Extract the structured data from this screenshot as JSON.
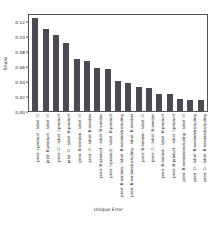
{
  "chart_data": {
    "type": "bar",
    "title": "",
    "xlabel": "Unique Error",
    "ylabel": "Share",
    "ylim": [
      0.0,
      0.13
    ],
    "ytick_labels": [
      "0.00",
      "0.02",
      "0.04",
      "0.06",
      "0.08",
      "0.10",
      "0.12"
    ],
    "ytick_values": [
      0.0,
      0.02,
      0.04,
      0.06,
      0.08,
      0.1,
      0.12
    ],
    "grid": false,
    "legend": null,
    "bar_color": "#4a4a52",
    "categories": [
      "pred: I-product - label: O",
      "pred: B-product - label: O",
      "pred: O - label: I-product",
      "pred: O - label: B-product",
      "pred: B-version - label: O",
      "pred: O - label: B-version",
      "pred: B-product - label: B-vendor",
      "pred: I-product - label: B-product",
      "pred: B-version - label: B-version/including",
      "pred: B-version/including - label: B-version",
      "pred: B-vendor - label: O",
      "pred: O - label: B-vendor",
      "pred: B-vendor - label: B-product",
      "pred: B-product - label: I-product",
      "pred: B-version/including - label: O",
      "pred: O - label: B-version/including",
      "pred: O - label: B-version/including"
    ],
    "values": [
      0.123,
      0.109,
      0.101,
      0.09,
      0.069,
      0.066,
      0.057,
      0.056,
      0.04,
      0.037,
      0.032,
      0.03,
      0.023,
      0.023,
      0.016,
      0.014,
      0.014
    ]
  }
}
